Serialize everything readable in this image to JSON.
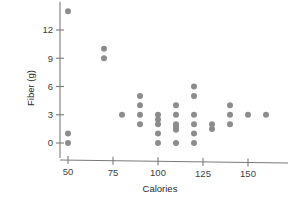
{
  "chart_data": {
    "type": "scatter",
    "title": "",
    "xlabel": "Calories",
    "ylabel": "Fiber (g)",
    "xlim": [
      42,
      168
    ],
    "ylim": [
      -0.6,
      14.8
    ],
    "xticks": [
      50,
      75,
      100,
      125,
      150
    ],
    "xticklabels": [
      "50",
      "75",
      "100",
      "125",
      "150"
    ],
    "yticks": [
      0,
      3,
      6,
      9,
      12
    ],
    "yticklabels": [
      "0",
      "3",
      "6",
      "9",
      "12"
    ],
    "grid": false,
    "legend": null,
    "marker": {
      "shape": "circle",
      "color": "#8c8c8c",
      "size": 3.0
    },
    "points": [
      {
        "x": 50,
        "y": 14
      },
      {
        "x": 50,
        "y": 1
      },
      {
        "x": 50,
        "y": 0
      },
      {
        "x": 70,
        "y": 10
      },
      {
        "x": 70,
        "y": 9
      },
      {
        "x": 80,
        "y": 3
      },
      {
        "x": 90,
        "y": 5
      },
      {
        "x": 90,
        "y": 4
      },
      {
        "x": 90,
        "y": 3
      },
      {
        "x": 90,
        "y": 2
      },
      {
        "x": 100,
        "y": 3
      },
      {
        "x": 100,
        "y": 2.5
      },
      {
        "x": 100,
        "y": 2
      },
      {
        "x": 100,
        "y": 1
      },
      {
        "x": 100,
        "y": 0
      },
      {
        "x": 110,
        "y": 4
      },
      {
        "x": 110,
        "y": 3
      },
      {
        "x": 110,
        "y": 2
      },
      {
        "x": 110,
        "y": 1.7
      },
      {
        "x": 110,
        "y": 1.4
      },
      {
        "x": 110,
        "y": 0
      },
      {
        "x": 120,
        "y": 6
      },
      {
        "x": 120,
        "y": 5
      },
      {
        "x": 120,
        "y": 3
      },
      {
        "x": 120,
        "y": 2
      },
      {
        "x": 120,
        "y": 1
      },
      {
        "x": 120,
        "y": 0
      },
      {
        "x": 130,
        "y": 2
      },
      {
        "x": 130,
        "y": 1.5
      },
      {
        "x": 140,
        "y": 4
      },
      {
        "x": 140,
        "y": 3
      },
      {
        "x": 140,
        "y": 2
      },
      {
        "x": 150,
        "y": 3
      },
      {
        "x": 160,
        "y": 3
      }
    ]
  }
}
